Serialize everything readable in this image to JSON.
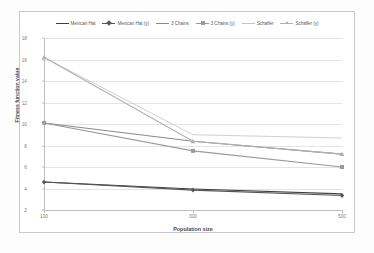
{
  "chart_data": {
    "type": "line",
    "title": "",
    "xlabel": "Population size",
    "ylabel": "Fitness function value",
    "categories": [
      "100",
      "300",
      "500"
    ],
    "x": [
      100,
      300,
      500
    ],
    "ylim": [
      2,
      18
    ],
    "yticks": [
      2,
      4,
      6,
      8,
      10,
      12,
      14,
      16,
      18
    ],
    "grid": true,
    "legend_position": "top",
    "series": [
      {
        "name": "Mexican Hat",
        "values": [
          4.6,
          3.95,
          3.5
        ],
        "color": "#3f3f3f",
        "marker": "none"
      },
      {
        "name": "Mexican Hat (y)",
        "values": [
          4.6,
          3.85,
          3.35
        ],
        "color": "#555555",
        "marker": "diamond"
      },
      {
        "name": "3 Chains",
        "values": [
          10.1,
          8.4,
          7.2
        ],
        "color": "#8a8a8a",
        "marker": "none"
      },
      {
        "name": "3 Chains (y)",
        "values": [
          10.1,
          7.5,
          6.0
        ],
        "color": "#9a9a9a",
        "marker": "square"
      },
      {
        "name": "Schaffer",
        "values": [
          16.2,
          9.0,
          8.7
        ],
        "color": "#c4c4c4",
        "marker": "none"
      },
      {
        "name": "Schaffer (y)",
        "values": [
          16.2,
          8.4,
          7.2
        ],
        "color": "#b0b0b0",
        "marker": "triangle"
      }
    ]
  },
  "legend": {
    "items": [
      {
        "label": "Mexican Hat"
      },
      {
        "label": "Mexican Hat (y)"
      },
      {
        "label": "3 Chains"
      },
      {
        "label": "3 Chains (y)"
      },
      {
        "label": "Schaffer"
      },
      {
        "label": "Schaffer (y)"
      }
    ]
  }
}
